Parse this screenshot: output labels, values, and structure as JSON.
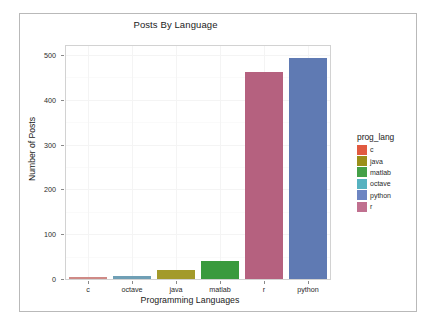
{
  "figure": {
    "background": "#ffffff",
    "border_color": "#b9b9b9",
    "panel_border_color": "#d2d2d2",
    "grid_color": "#f4f4f4"
  },
  "chart_data": {
    "type": "bar",
    "title": "Posts By Language",
    "xlabel": "Programming Languages",
    "ylabel": "Number of Posts",
    "categories": [
      "c",
      "octave",
      "java",
      "matlab",
      "r",
      "python"
    ],
    "values": [
      3,
      6,
      21,
      40,
      463,
      494
    ],
    "colors": [
      "#cf8a86",
      "#6f9fb5",
      "#a39a2a",
      "#3a9a3e",
      "#b5617f",
      "#5f7ab3"
    ],
    "ylim": [
      0,
      520
    ],
    "yticks": [
      0,
      100,
      200,
      300,
      400,
      500
    ],
    "ytick_labels": [
      "0",
      "100",
      "200",
      "300",
      "400",
      "500"
    ],
    "grid": true,
    "legend_position": "right"
  },
  "legend": {
    "title": "prog_lang",
    "entries": [
      {
        "label": "c",
        "color": "#e15a40"
      },
      {
        "label": "java",
        "color": "#9a8f19"
      },
      {
        "label": "matlab",
        "color": "#44a048"
      },
      {
        "label": "octave",
        "color": "#56b2c0"
      },
      {
        "label": "python",
        "color": "#6d85c2"
      },
      {
        "label": "r",
        "color": "#c0708f"
      }
    ]
  }
}
